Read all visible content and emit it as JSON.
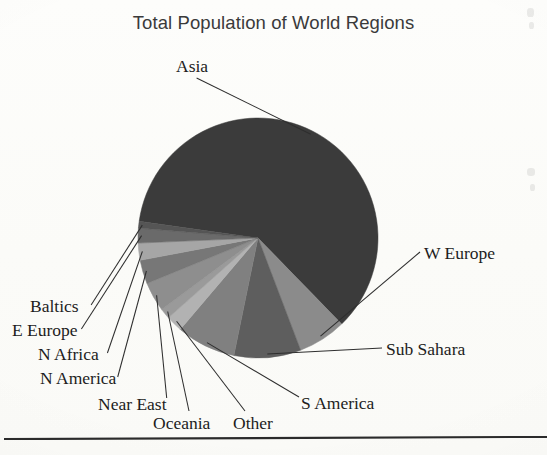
{
  "document": {
    "title": "Total Population of World Regions",
    "background_color": "#fcfcfa",
    "rule_color": "#2b2b2b"
  },
  "chart_data": {
    "type": "pie",
    "title": "Total Population of World Regions",
    "xlabel": "",
    "ylabel": "",
    "legend_position": "outside-callout-labels",
    "grid": false,
    "start_angle_deg": 188,
    "direction": "clockwise",
    "center": {
      "x": 258,
      "y": 238
    },
    "radius": 120,
    "categories": [
      "Asia",
      "W Europe",
      "Sub Sahara",
      "S America",
      "Other",
      "Oceania",
      "Near East",
      "N America",
      "N Africa",
      "E Europe",
      "Baltics"
    ],
    "values": [
      60.5,
      6.5,
      9.0,
      8.0,
      2.2,
      1.4,
      4.0,
      3.2,
      2.3,
      2.0,
      0.9
    ],
    "slice_colors": [
      "#3b3b3b",
      "#8b8b8b",
      "#5e5e5e",
      "#808080",
      "#b2b2b2",
      "#9a9a9a",
      "#8e8e8e",
      "#777777",
      "#a6a6a6",
      "#6a6a6a",
      "#555555"
    ],
    "labels": [
      {
        "text": "Asia",
        "x": 176,
        "y": 58,
        "anchor": "start"
      },
      {
        "text": "W Europe",
        "x": 424,
        "y": 245,
        "anchor": "start"
      },
      {
        "text": "Sub Sahara",
        "x": 386,
        "y": 341,
        "anchor": "start"
      },
      {
        "text": "S America",
        "x": 301,
        "y": 395,
        "anchor": "start"
      },
      {
        "text": "Other",
        "x": 233,
        "y": 415,
        "anchor": "start"
      },
      {
        "text": "Oceania",
        "x": 153,
        "y": 415,
        "anchor": "start"
      },
      {
        "text": "Near East",
        "x": 98,
        "y": 396,
        "anchor": "start"
      },
      {
        "text": "N America",
        "x": 40,
        "y": 370,
        "anchor": "start"
      },
      {
        "text": "N Africa",
        "x": 38,
        "y": 346,
        "anchor": "start"
      },
      {
        "text": "E Europe",
        "x": 12,
        "y": 322,
        "anchor": "start"
      },
      {
        "text": "Baltics",
        "x": 30,
        "y": 298,
        "anchor": "start"
      }
    ]
  }
}
